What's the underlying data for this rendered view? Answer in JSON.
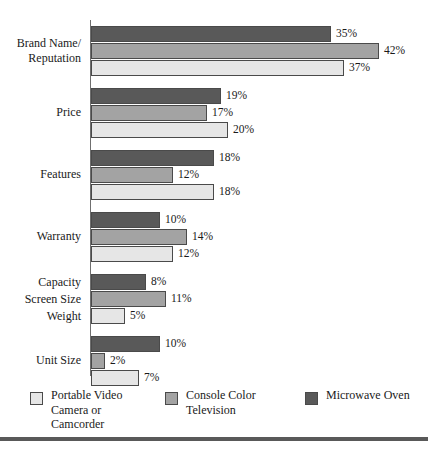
{
  "chart_data": {
    "type": "bar",
    "orientation": "horizontal",
    "title": "",
    "subtitle": "",
    "xlabel": "",
    "ylabel": "",
    "xlim": [
      0,
      45
    ],
    "grid": false,
    "legend_position": "bottom",
    "value_suffix": "%",
    "categories": [
      "Brand Name/\nReputation",
      "Price",
      "Features",
      "Warranty",
      "Capacity\nScreen Size\nWeight",
      "Unit Size"
    ],
    "series": [
      {
        "name": "Microwave Oven",
        "color": "#595959",
        "values": [
          35,
          19,
          18,
          10,
          8,
          10
        ],
        "labels": [
          "35%",
          "19%",
          "18%",
          "10%",
          "8%",
          "10%"
        ]
      },
      {
        "name": "Console Color Television",
        "color": "#a3a3a3",
        "values": [
          42,
          17,
          12,
          14,
          11,
          2
        ],
        "labels": [
          "42%",
          "17%",
          "12%",
          "14%",
          "11%",
          "2%"
        ]
      },
      {
        "name": "Portable Video Camera or Camcorder",
        "color": "#e6e6e6",
        "values": [
          37,
          20,
          18,
          12,
          5,
          7
        ],
        "labels": [
          "37%",
          "20%",
          "18%",
          "12%",
          "5%",
          "7%"
        ]
      }
    ]
  },
  "groups": [
    {
      "label": "Brand Name/\nReputation",
      "label_lines": [
        "Brand Name/",
        "Reputation"
      ],
      "bars": [
        {
          "series": "Microwave Oven",
          "value": 35,
          "label": "35%",
          "swatch": "s2"
        },
        {
          "series": "Console Color Television",
          "value": 42,
          "label": "42%",
          "swatch": "s1"
        },
        {
          "series": "Portable Video Camera or Camcorder",
          "value": 37,
          "label": "37%",
          "swatch": "s0"
        }
      ]
    },
    {
      "label": "Price",
      "label_lines": [
        "Price"
      ],
      "bars": [
        {
          "series": "Microwave Oven",
          "value": 19,
          "label": "19%",
          "swatch": "s2"
        },
        {
          "series": "Console Color Television",
          "value": 17,
          "label": "17%",
          "swatch": "s1"
        },
        {
          "series": "Portable Video Camera or Camcorder",
          "value": 20,
          "label": "20%",
          "swatch": "s0"
        }
      ]
    },
    {
      "label": "Features",
      "label_lines": [
        "Features"
      ],
      "bars": [
        {
          "series": "Microwave Oven",
          "value": 18,
          "label": "18%",
          "swatch": "s2"
        },
        {
          "series": "Console Color Television",
          "value": 12,
          "label": "12%",
          "swatch": "s1"
        },
        {
          "series": "Portable Video Camera or Camcorder",
          "value": 18,
          "label": "18%",
          "swatch": "s0"
        }
      ]
    },
    {
      "label": "Warranty",
      "label_lines": [
        "Warranty"
      ],
      "bars": [
        {
          "series": "Microwave Oven",
          "value": 10,
          "label": "10%",
          "swatch": "s2"
        },
        {
          "series": "Console Color Television",
          "value": 14,
          "label": "14%",
          "swatch": "s1"
        },
        {
          "series": "Portable Video Camera or Camcorder",
          "value": 12,
          "label": "12%",
          "swatch": "s0"
        }
      ]
    },
    {
      "label": "Capacity\nScreen Size\nWeight",
      "label_lines": [
        "Capacity",
        "Screen Size",
        "Weight"
      ],
      "bars": [
        {
          "series": "Microwave Oven",
          "value": 8,
          "label": "8%",
          "swatch": "s2"
        },
        {
          "series": "Console Color Television",
          "value": 11,
          "label": "11%",
          "swatch": "s1"
        },
        {
          "series": "Portable Video Camera or Camcorder",
          "value": 5,
          "label": "5%",
          "swatch": "s0"
        }
      ]
    },
    {
      "label": "Unit Size",
      "label_lines": [
        "Unit Size"
      ],
      "bars": [
        {
          "series": "Microwave Oven",
          "value": 10,
          "label": "10%",
          "swatch": "s2"
        },
        {
          "series": "Console Color Television",
          "value": 2,
          "label": "2%",
          "swatch": "s1"
        },
        {
          "series": "Portable Video Camera or Camcorder",
          "value": 7,
          "label": "7%",
          "swatch": "s0"
        }
      ]
    }
  ],
  "legend": {
    "items": [
      {
        "label": "Portable Video\nCamera or\nCamcorder",
        "swatch": "s0",
        "color": "#e6e6e6"
      },
      {
        "label": "Console Color\nTelevision",
        "swatch": "s1",
        "color": "#a3a3a3"
      },
      {
        "label": "Microwave Oven",
        "swatch": "s2",
        "color": "#595959"
      }
    ]
  },
  "style": {
    "series_colors": [
      "#e6e6e6",
      "#a3a3a3",
      "#595959"
    ],
    "axis_color": "#6f6f6f",
    "rule_color": "#595959",
    "background": "#ffffff"
  }
}
